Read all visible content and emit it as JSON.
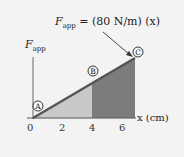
{
  "figure": {
    "equation_label": {
      "prefix": "F",
      "subscript": "app",
      "rest": " = (80 N/m) (x)"
    },
    "y_axis_label": {
      "base": "F",
      "subscript": "app"
    },
    "x_axis_label": "x (cm)",
    "x_ticks": [
      "0",
      "2",
      "4",
      "6"
    ],
    "points": [
      {
        "id": "A",
        "label": "A"
      },
      {
        "id": "B",
        "label": "B"
      },
      {
        "id": "C",
        "label": "C"
      }
    ],
    "colors": {
      "background": "#f3f3f3",
      "line": "#555555",
      "light_region": "#c8c8c8",
      "dark_region": "#7d7d7d",
      "axis": "#555555"
    }
  }
}
